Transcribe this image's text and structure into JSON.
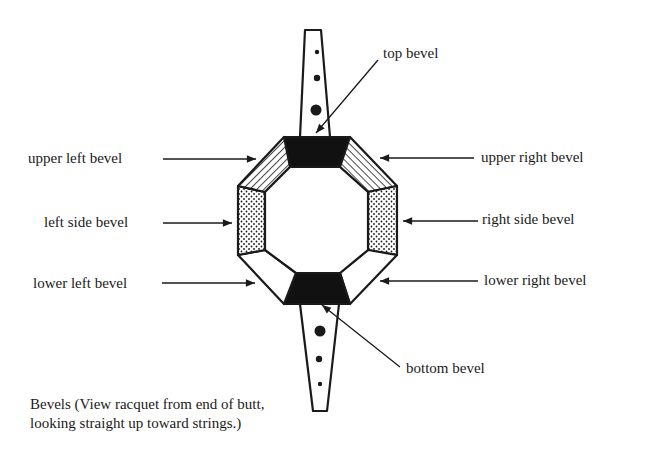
{
  "figure": {
    "labels": {
      "top": "top bevel",
      "upper_left": "upper left bevel",
      "upper_right": "upper right bevel",
      "left_side": "left side bevel",
      "right_side": "right side bevel",
      "lower_left": "lower left bevel",
      "lower_right": "lower right bevel",
      "bottom": "bottom bevel"
    },
    "caption": "Bevels (View racquet from end of butt, looking straight up toward strings.)",
    "fills": {
      "top_bottom": "solid black",
      "upper_left_right": "diagonal stripes",
      "left_right_side": "dotted",
      "lower_left_right": "white"
    },
    "colors": {
      "ink": "#1a1a1a",
      "background": "#ffffff"
    }
  }
}
